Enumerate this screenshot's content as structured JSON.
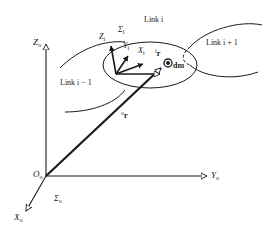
{
  "diagram": {
    "title": "",
    "colors": {
      "stroke": "#1a1a1a",
      "background": "#ffffff"
    },
    "base_frame": {
      "origin_label": "O",
      "origin_sub": "o",
      "frame_label": "Σ",
      "frame_sub": "o",
      "axes": [
        {
          "name": "Z",
          "sub": "o"
        },
        {
          "name": "Y",
          "sub": "o"
        },
        {
          "name": "X",
          "sub": "o"
        }
      ]
    },
    "link_frame": {
      "frame_label": "Σ",
      "frame_sub": "i",
      "axes": [
        {
          "name": "Z",
          "sub": "i"
        },
        {
          "name": "Y",
          "sub": "i"
        },
        {
          "name": "X",
          "sub": "i"
        }
      ]
    },
    "links": [
      {
        "label": "Link i − 1"
      },
      {
        "label": "Link i"
      },
      {
        "label": "Link i + 1"
      }
    ],
    "vectors": {
      "local_r": {
        "prefix": "i",
        "name": "r"
      },
      "global_r": {
        "prefix": "o",
        "name": "r"
      }
    },
    "mass_element": {
      "label": "dm"
    }
  }
}
